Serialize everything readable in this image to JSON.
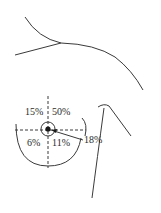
{
  "figure": {
    "type": "anatomical-diagram",
    "quadrants": {
      "upper_inner": "15%",
      "upper_outer": "50%",
      "lower_inner": "6%",
      "lower_outer": "11%",
      "central": "18%"
    },
    "colors": {
      "line": "#3a3a3a",
      "text": "#2a2a2a",
      "background": "#ffffff"
    }
  }
}
